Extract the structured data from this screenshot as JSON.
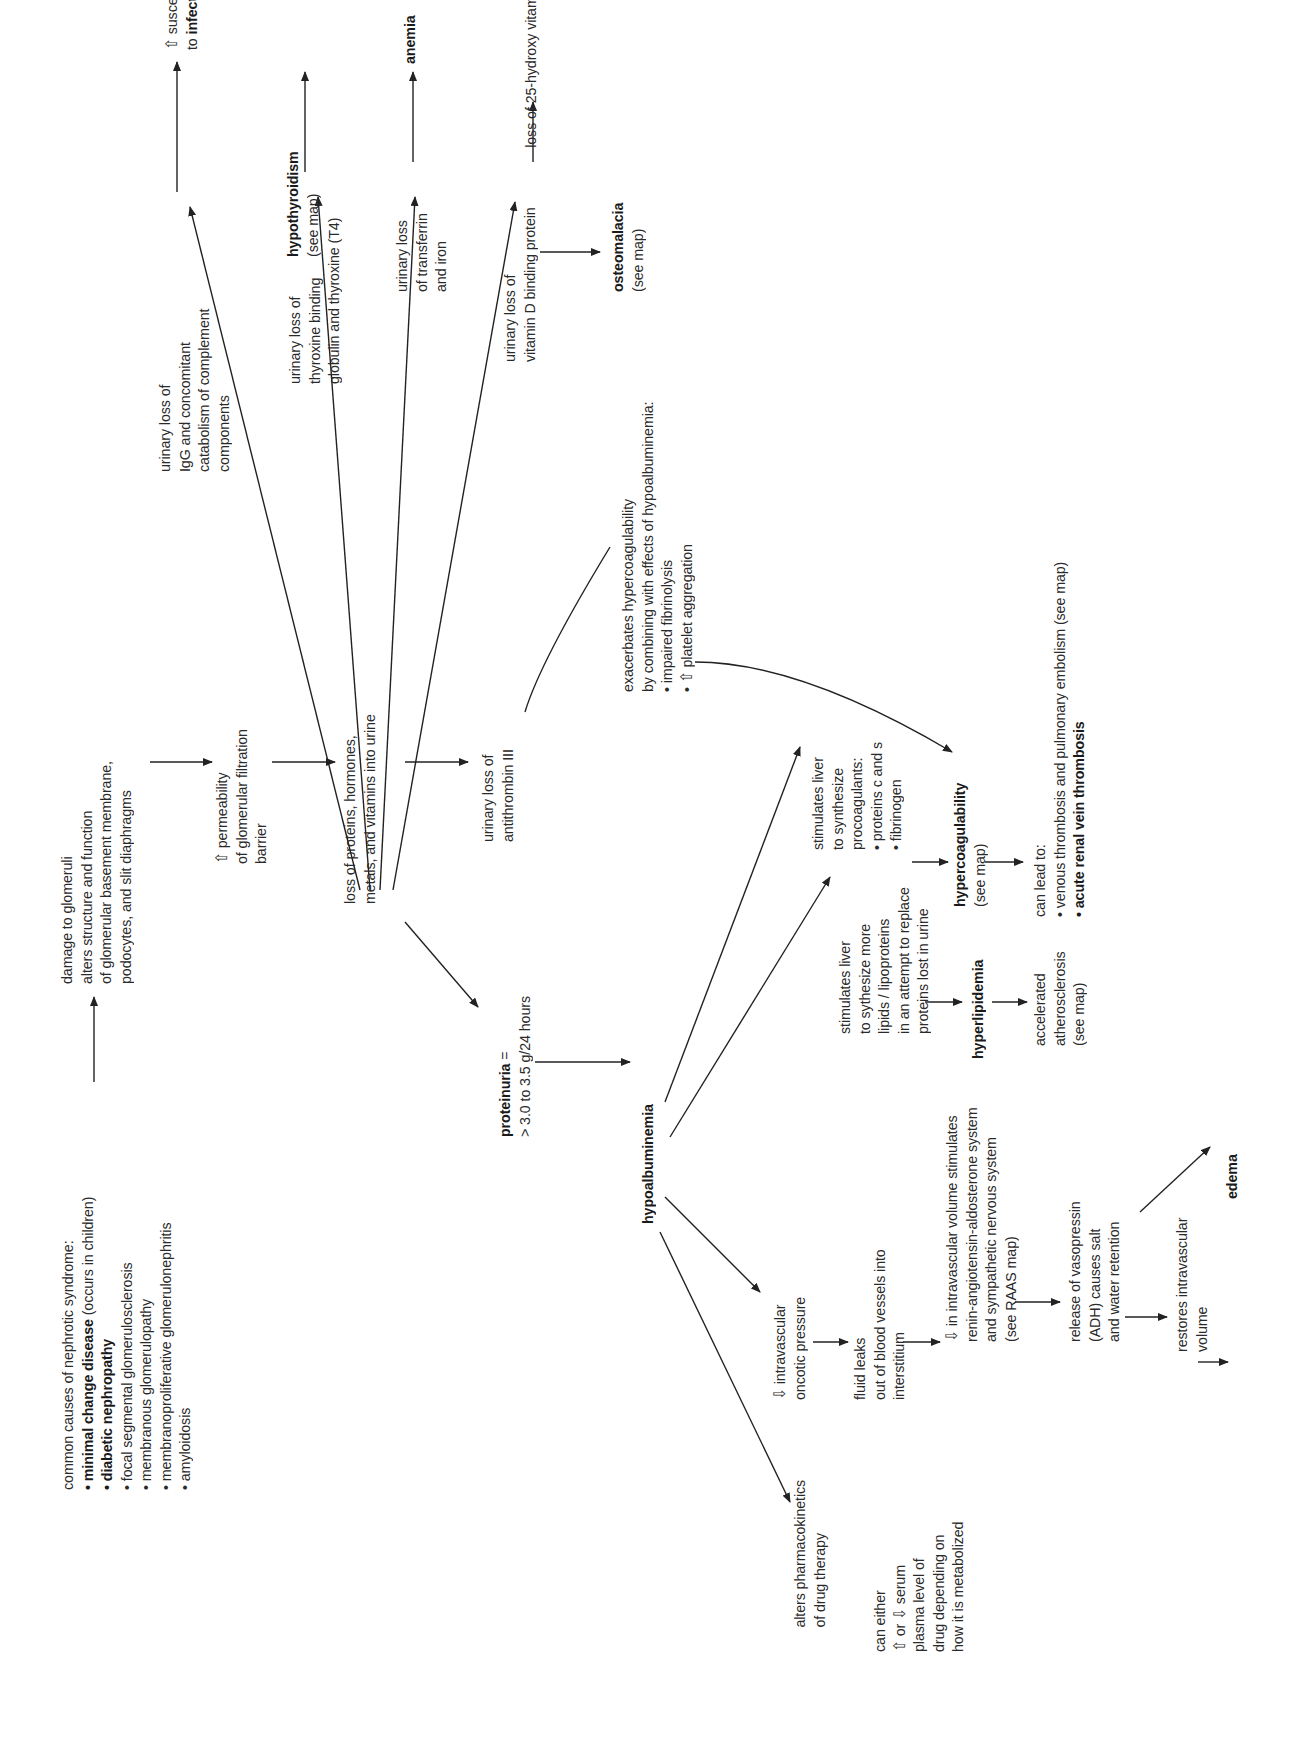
{
  "diagram": {
    "topic": "nephrotic syndrome",
    "orientation": "page rotated 90deg counter-clockwise",
    "nodes": {
      "causes": {
        "title": "common causes of nephrotic syndrome:",
        "items": [
          {
            "bold": "• minimal change disease",
            "rest": " (occurs in children)"
          },
          {
            "bold": "• diabetic nephropathy",
            "rest": ""
          },
          {
            "bold": "",
            "rest": "• focal segmental glomerulosclerosis"
          },
          {
            "bold": "",
            "rest": "• membranous glomerulopathy"
          },
          {
            "bold": "",
            "rest": "• membranoproliferative glomerulonephritis"
          },
          {
            "bold": "",
            "rest": "• amyloidosis"
          }
        ]
      },
      "damage": {
        "lines": [
          "damage to glomeruli",
          "alters structure and function",
          "of glomerular basement membrane,",
          "podocytes, and slit diaphragms"
        ]
      },
      "permeability": {
        "lines": [
          "⇧ permeability",
          "of glomerular filtration",
          "barrier"
        ]
      },
      "loss": {
        "lines": [
          "loss of proteins, hormones,",
          "metals, and vitamins into urine"
        ]
      },
      "igg": {
        "lines": [
          "urinary loss of",
          "IgG and concomitant",
          "catabolism of complement",
          "components"
        ]
      },
      "infection": {
        "line1": "⇧ susceptibility",
        "line2_pre": "to ",
        "line2_bold": "infection",
        "line2_post": " (especially peritonitis)"
      },
      "tbg": {
        "lines": [
          "urinary loss of",
          "thyroxine binding",
          "globulin and thyroxine (T4)"
        ]
      },
      "hypothyroidism": {
        "title": "hypothyroidism",
        "sub": "(see map)"
      },
      "transferrin": {
        "lines": [
          "urinary loss",
          "of transferrin",
          "and iron"
        ]
      },
      "anemia": {
        "title": "anemia"
      },
      "vitd_bp": {
        "lines": [
          "urinary loss of",
          "vitamin D binding protein"
        ]
      },
      "vitd25": {
        "lines": [
          "loss of 25-hydroxy vitamin D"
        ]
      },
      "osteomalacia": {
        "title": "osteomalacia",
        "sub": "(see map)"
      },
      "antithrombin": {
        "lines": [
          "urinary loss of",
          "antithrombin III"
        ]
      },
      "exacerbates": {
        "lines": [
          "exacerbates hypercoagulability",
          "by combining with effects of hypoalbuminemia:",
          "• impaired fibrinolysis",
          "• ⇧ platelet aggregation"
        ]
      },
      "proteinuria": {
        "title": "proteinuria",
        "title_suffix": " =",
        "sub": "> 3.0 to 3.5 g/24 hours"
      },
      "hypoalbuminemia": {
        "title": "hypoalbuminemia"
      },
      "procoag": {
        "lines": [
          "stimulates liver",
          "to synthesize",
          "procoagulants:",
          "• proteins c and s",
          "• fibrinogen"
        ]
      },
      "hypercoag": {
        "title": "hypercoagulability",
        "sub": "(see map)"
      },
      "leadto": {
        "line1": "can lead to:",
        "line2": "• venous thrombosis and pulmonary embolism (see map)",
        "line3_bold": "• acute renal vein thrombosis"
      },
      "lipids": {
        "lines": [
          "stimulates liver",
          "to sythesize more",
          "lipids / lipoproteins",
          "in an attempt to replace",
          "proteins lost in urine"
        ]
      },
      "hyperlipidemia": {
        "title": "hyperlipidemia"
      },
      "athero": {
        "lines": [
          "accelerated",
          "atherosclerosis",
          "(see map)"
        ]
      },
      "oncotic": {
        "lines": [
          "⇩ intravascular",
          "oncotic pressure"
        ]
      },
      "fluid": {
        "lines": [
          "fluid leaks",
          "out of blood vessels into",
          "interstitium"
        ]
      },
      "raas": {
        "lines": [
          "⇩ in intravascular volume stimulates",
          "renin-angiotensin-aldosterone system",
          "and sympathetic nervous system",
          "(see RAAS map)"
        ]
      },
      "adh": {
        "lines": [
          "release of vasopressin",
          "(ADH) causes salt",
          "and water retention"
        ]
      },
      "restores": {
        "lines": [
          "restores intravascular",
          "volume"
        ]
      },
      "edema": {
        "title": "edema"
      },
      "pharma": {
        "lines": [
          "alters pharmacokinetics",
          "of drug therapy"
        ]
      },
      "drug": {
        "lines": [
          "can either",
          "⇧ or ⇩ serum",
          "plasma level of",
          "drug depending on",
          "how it is metabolized"
        ]
      }
    },
    "colors": {
      "ink": "#222222",
      "background": "#ffffff"
    }
  }
}
